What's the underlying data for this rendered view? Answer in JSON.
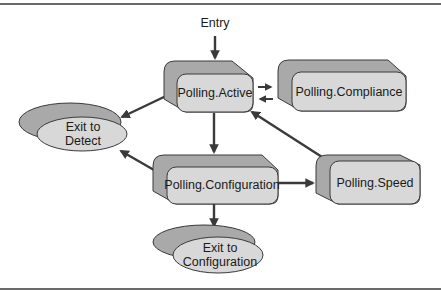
{
  "diagram": {
    "type": "state-diagram",
    "colors": {
      "front_fill": "#d8d8d8",
      "back_fill": "#a9a9a9",
      "stroke": "#3a3a3a",
      "arrow": "#3a3a3a",
      "rule": "#6a6a6a"
    },
    "entry_label": "Entry",
    "states": {
      "active": "Polling.Active",
      "compliance": "Polling.Compliance",
      "configuration": "Polling.Configuration",
      "speed": "Polling.Speed"
    },
    "exits": {
      "detect_line1": "Exit to",
      "detect_line2": "Detect",
      "config_line1": "Exit to",
      "config_line2": "Configuration"
    },
    "transitions": [
      {
        "from": "Entry",
        "to": "Polling.Active"
      },
      {
        "from": "Polling.Active",
        "to": "Polling.Compliance"
      },
      {
        "from": "Polling.Compliance",
        "to": "Polling.Active"
      },
      {
        "from": "Polling.Active",
        "to": "Exit to Detect"
      },
      {
        "from": "Polling.Active",
        "to": "Polling.Configuration"
      },
      {
        "from": "Polling.Configuration",
        "to": "Exit to Detect"
      },
      {
        "from": "Polling.Configuration",
        "to": "Polling.Speed"
      },
      {
        "from": "Polling.Speed",
        "to": "Polling.Active"
      },
      {
        "from": "Polling.Configuration",
        "to": "Exit to Configuration"
      }
    ]
  }
}
